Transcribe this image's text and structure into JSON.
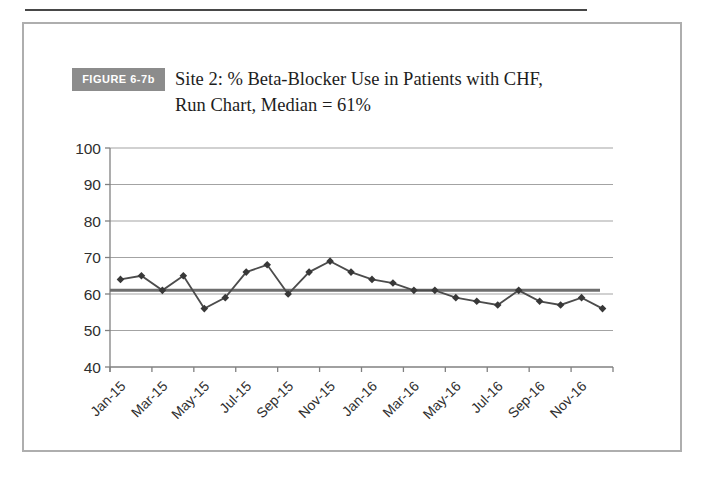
{
  "figure": {
    "tag": "FIGURE 6-7b",
    "title_line1": "Site 2: % Beta-Blocker Use in Patients with CHF,",
    "title_line2": "Run Chart, Median = 61%"
  },
  "colors": {
    "top_rule": "#474747",
    "frame_border": "#aeaeae",
    "tag_bg": "#8c8c8c",
    "tag_text": "#ffffff",
    "title_text": "#1d1d1d",
    "tick_text": "#2f2f2f",
    "grid": "#a3a3a3",
    "axis": "#808080",
    "series_line": "#4c4c4c",
    "marker": "#383838",
    "median_line": "#6e6e6e"
  },
  "chart_data": {
    "type": "line",
    "title": "Site 2: % Beta-Blocker Use in Patients with CHF, Run Chart, Median = 61%",
    "xlabel": "",
    "ylabel": "",
    "categories": [
      "Jan-15",
      "Feb-15",
      "Mar-15",
      "Apr-15",
      "May-15",
      "Jun-15",
      "Jul-15",
      "Aug-15",
      "Sep-15",
      "Oct-15",
      "Nov-15",
      "Dec-15",
      "Jan-16",
      "Feb-16",
      "Mar-16",
      "Apr-16",
      "May-16",
      "Jun-16",
      "Jul-16",
      "Aug-16",
      "Sep-16",
      "Oct-16",
      "Nov-16",
      "Dec-16"
    ],
    "values": [
      64,
      65,
      61,
      65,
      56,
      59,
      66,
      68,
      60,
      66,
      69,
      66,
      64,
      63,
      61,
      61,
      59,
      58,
      57,
      61,
      58,
      57,
      59,
      56
    ],
    "median": 61,
    "ylim": [
      40,
      100
    ],
    "yticks": [
      40,
      50,
      60,
      70,
      80,
      90,
      100
    ],
    "x_tick_labels": [
      "Jan-15",
      "Mar-15",
      "May-15",
      "Jul-15",
      "Sep-15",
      "Nov-15",
      "Jan-16",
      "Mar-16",
      "May-16",
      "Jul-16",
      "Sep-16",
      "Nov-16"
    ],
    "x_label_every": 2,
    "grid": "horizontal",
    "legend": "none",
    "marker": "diamond"
  }
}
